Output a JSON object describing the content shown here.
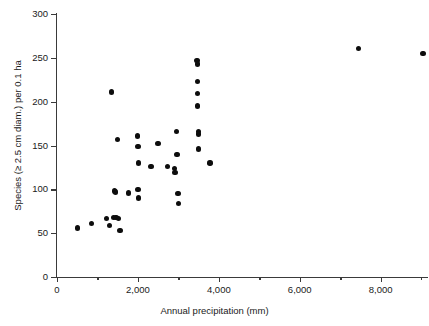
{
  "chart_data": {
    "type": "scatter",
    "title": "",
    "xlabel": "Annual precipitation (mm)",
    "ylabel": "Species (≥ 2.5 cm diam.) per 0.1 ha",
    "xlim": [
      0,
      9170
    ],
    "ylim": [
      0,
      300
    ],
    "grid": false,
    "legend": null,
    "xticks": [
      0,
      1000,
      2000,
      3000,
      4000,
      5000,
      6000,
      7000,
      8000,
      9000
    ],
    "xtick_labels": [
      "0",
      "",
      "2,000",
      "",
      "4,000",
      "",
      "6,000",
      "",
      "8,000",
      ""
    ],
    "yticks": [
      0,
      50,
      100,
      150,
      200,
      250,
      300
    ],
    "ytick_labels": [
      "0",
      "50",
      "100",
      "150",
      "200",
      "250",
      "300"
    ],
    "marker": "filled-circle",
    "marker_color": "#0d0d0d",
    "points": [
      {
        "x": 500,
        "y": 56
      },
      {
        "x": 850,
        "y": 61
      },
      {
        "x": 1220,
        "y": 67
      },
      {
        "x": 1300,
        "y": 59
      },
      {
        "x": 1350,
        "y": 211
      },
      {
        "x": 1390,
        "y": 68
      },
      {
        "x": 1420,
        "y": 98
      },
      {
        "x": 1450,
        "y": 97
      },
      {
        "x": 1460,
        "y": 68
      },
      {
        "x": 1500,
        "y": 157
      },
      {
        "x": 1520,
        "y": 67
      },
      {
        "x": 1560,
        "y": 53
      },
      {
        "x": 1760,
        "y": 96
      },
      {
        "x": 1990,
        "y": 161
      },
      {
        "x": 2000,
        "y": 149
      },
      {
        "x": 2000,
        "y": 100
      },
      {
        "x": 2010,
        "y": 130
      },
      {
        "x": 2020,
        "y": 90
      },
      {
        "x": 2320,
        "y": 126
      },
      {
        "x": 2500,
        "y": 152
      },
      {
        "x": 2730,
        "y": 126
      },
      {
        "x": 2900,
        "y": 124
      },
      {
        "x": 2920,
        "y": 119
      },
      {
        "x": 2960,
        "y": 166
      },
      {
        "x": 2970,
        "y": 140
      },
      {
        "x": 2990,
        "y": 95
      },
      {
        "x": 3000,
        "y": 84
      },
      {
        "x": 3460,
        "y": 247
      },
      {
        "x": 3470,
        "y": 243
      },
      {
        "x": 3470,
        "y": 223
      },
      {
        "x": 3480,
        "y": 209
      },
      {
        "x": 3480,
        "y": 195
      },
      {
        "x": 3490,
        "y": 166
      },
      {
        "x": 3490,
        "y": 163
      },
      {
        "x": 3500,
        "y": 146
      },
      {
        "x": 3780,
        "y": 130
      },
      {
        "x": 7450,
        "y": 261
      },
      {
        "x": 9050,
        "y": 255
      }
    ]
  },
  "axes": {
    "y_ticks": [
      {
        "value": 300,
        "label": "300"
      },
      {
        "value": 250,
        "label": "250"
      },
      {
        "value": 200,
        "label": "200"
      },
      {
        "value": 150,
        "label": "150"
      },
      {
        "value": 100,
        "label": "100"
      },
      {
        "value": 50,
        "label": "50"
      },
      {
        "value": 0,
        "label": "0"
      }
    ],
    "x_ticks": [
      {
        "value": 0,
        "label": "0",
        "minor": false
      },
      {
        "value": 1000,
        "label": "",
        "minor": true
      },
      {
        "value": 2000,
        "label": "2,000",
        "minor": false
      },
      {
        "value": 3000,
        "label": "",
        "minor": true
      },
      {
        "value": 4000,
        "label": "4,000",
        "minor": false
      },
      {
        "value": 5000,
        "label": "",
        "minor": true
      },
      {
        "value": 6000,
        "label": "6,000",
        "minor": false
      },
      {
        "value": 7000,
        "label": "",
        "minor": true
      },
      {
        "value": 8000,
        "label": "8,000",
        "minor": false
      },
      {
        "value": 9000,
        "label": "",
        "minor": true
      }
    ]
  },
  "labels": {
    "x_axis_title": "Annual precipitation (mm)",
    "y_axis_title": "Species (≥ 2.5 cm diam.) per 0.1 ha",
    "top_caption": ""
  }
}
